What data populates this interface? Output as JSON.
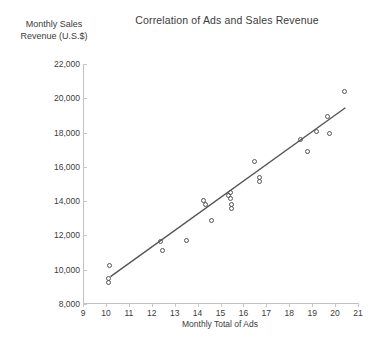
{
  "chart_data": {
    "type": "scatter",
    "title": "Correlation of Ads and Sales Revenue",
    "xlabel": "Monthly Total of Ads",
    "ylabel": "Monthly Sales Revenue (U.S.$)",
    "ylabel_line1": "Monthly Sales",
    "ylabel_line2": "Revenue (U.S.$)",
    "xlim": [
      9,
      21
    ],
    "ylim": [
      8000,
      22000
    ],
    "xticks": [
      9,
      10,
      11,
      12,
      13,
      14,
      15,
      16,
      17,
      18,
      19,
      20,
      21
    ],
    "xtick_labels": [
      "9",
      "10",
      "11",
      "12",
      "13",
      "14",
      "15",
      "16",
      "17",
      "18",
      "19",
      "20",
      "21"
    ],
    "yticks": [
      8000,
      10000,
      12000,
      14000,
      16000,
      18000,
      20000,
      22000
    ],
    "ytick_labels": [
      "8,000",
      "10,000",
      "12,000",
      "14,000",
      "16,000",
      "18,000",
      "20,000",
      "22,000"
    ],
    "grid": false,
    "legend": "none",
    "marker": "open-circle",
    "marker_color": "#555555",
    "trendline": {
      "visible": true,
      "color": "#555555",
      "x_start": 10.2,
      "y_start": 9600,
      "x_end": 20.45,
      "y_end": 19450
    },
    "points": [
      {
        "x": 10.15,
        "y": 10250
      },
      {
        "x": 10.1,
        "y": 9500
      },
      {
        "x": 10.1,
        "y": 9250
      },
      {
        "x": 12.4,
        "y": 11650
      },
      {
        "x": 12.45,
        "y": 11100
      },
      {
        "x": 13.5,
        "y": 11700
      },
      {
        "x": 14.25,
        "y": 14050
      },
      {
        "x": 14.35,
        "y": 13800
      },
      {
        "x": 14.6,
        "y": 12900
      },
      {
        "x": 15.35,
        "y": 14350
      },
      {
        "x": 15.45,
        "y": 14500
      },
      {
        "x": 15.45,
        "y": 14150
      },
      {
        "x": 15.5,
        "y": 13800
      },
      {
        "x": 15.5,
        "y": 13550
      },
      {
        "x": 16.5,
        "y": 16300
      },
      {
        "x": 16.7,
        "y": 15400
      },
      {
        "x": 16.7,
        "y": 15150
      },
      {
        "x": 18.5,
        "y": 17600
      },
      {
        "x": 18.8,
        "y": 16900
      },
      {
        "x": 19.2,
        "y": 18050
      },
      {
        "x": 19.65,
        "y": 18950
      },
      {
        "x": 19.75,
        "y": 17950
      },
      {
        "x": 20.4,
        "y": 20400
      }
    ]
  }
}
